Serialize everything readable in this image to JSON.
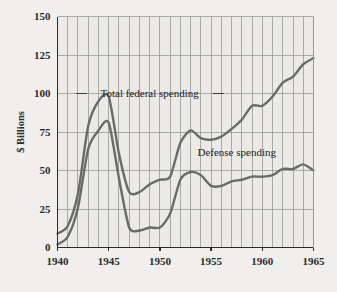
{
  "chart_data": {
    "type": "line",
    "title": "",
    "subtitle": "",
    "xlabel": "",
    "ylabel": "$ Billions",
    "xlim": [
      1940,
      1965
    ],
    "ylim": [
      0,
      150
    ],
    "grid": true,
    "grid_x_step": 1,
    "grid_y_step": 25,
    "legend_position": "inline-annotations",
    "x_ticks": [
      1940,
      1945,
      1950,
      1955,
      1960,
      1965
    ],
    "x_tick_labels": [
      "1940",
      "1945",
      "1950",
      "1955",
      "1960",
      "1965"
    ],
    "y_ticks": [
      0,
      25,
      50,
      75,
      100,
      125,
      150
    ],
    "y_tick_labels": [
      "0",
      "25",
      "50",
      "75",
      "100",
      "125",
      "150"
    ],
    "x": [
      1940,
      1941,
      1942,
      1943,
      1944,
      1945,
      1946,
      1947,
      1948,
      1949,
      1950,
      1951,
      1952,
      1953,
      1954,
      1955,
      1956,
      1957,
      1958,
      1959,
      1960,
      1961,
      1962,
      1963,
      1964,
      1965
    ],
    "series": [
      {
        "name": "Total federal spending",
        "color": "#6a6a6a",
        "values": [
          9,
          14,
          35,
          79,
          95,
          98,
          61,
          36,
          36,
          41,
          44,
          46,
          68,
          76,
          71,
          70,
          72,
          77,
          83,
          92,
          92,
          98,
          107,
          111,
          119,
          123
        ]
      },
      {
        "name": "Defense spending",
        "color": "#6a6a6a",
        "values": [
          2,
          7,
          26,
          64,
          76,
          81,
          45,
          13,
          11,
          13,
          13,
          22,
          44,
          49,
          47,
          40,
          40,
          43,
          44,
          46,
          46,
          47,
          51,
          51,
          54,
          50
        ]
      }
    ],
    "annotations": [
      {
        "text": "Total federal spending",
        "x": 1949.0,
        "y": 100,
        "leader_left": true,
        "leader_right": true
      },
      {
        "text": "Defense spending",
        "x": 1957.5,
        "y": 62,
        "leader_left": false,
        "leader_right": false
      }
    ],
    "style": {
      "plot_background": "#eceae7",
      "grid_color": "#8d8d8d",
      "axis_color": "#2b2b2b",
      "line_width": 2.4,
      "page_background": "#f0efed"
    }
  }
}
